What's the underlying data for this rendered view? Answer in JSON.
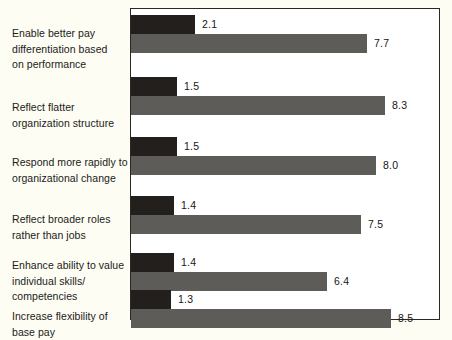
{
  "chart_data": {
    "type": "bar",
    "orientation": "horizontal",
    "title": "",
    "subtitle": "",
    "xlabel": "",
    "ylabel": "",
    "xlim": [
      0,
      10.1
    ],
    "grid": false,
    "legend": null,
    "categories": [
      "Enable better pay\ndifferentiation based\non performance",
      "Reflect flatter\norganization structure",
      "Respond more rapidly to\norganizational change",
      "Reflect broader roles\nrather than jobs",
      "Enhance ability to value\nindividual skills/\ncompetencies",
      "Increase flexibility of\nbase pay"
    ],
    "series": [
      {
        "name": "dark",
        "color": "#231f1c",
        "values": [
          2.1,
          1.5,
          1.5,
          1.4,
          1.4,
          1.3
        ],
        "labels": [
          "2.1",
          "1.5",
          "1.5",
          "1.4",
          "1.4",
          "1.3"
        ]
      },
      {
        "name": "gray",
        "color": "#5e5c58",
        "values": [
          7.7,
          8.3,
          8.0,
          7.5,
          6.4,
          8.5
        ],
        "labels": [
          "7.7",
          "8.3",
          "8.0",
          "7.5",
          "6.4",
          "8.5"
        ]
      }
    ]
  },
  "style": {
    "page_background": "#fdfdf4",
    "plot_background": "#ffffff",
    "border_color": "#2a2725",
    "dark_bar_color": "#231f1c",
    "gray_bar_color": "#5e5c58",
    "text_color": "#1c1a18"
  },
  "layout": {
    "px_per_unit": 30.6,
    "bar_height": 19,
    "group_tops": [
      6,
      68,
      128,
      187,
      244,
      281
    ],
    "label_tops": [
      26,
      100,
      155,
      212,
      258,
      309
    ]
  }
}
